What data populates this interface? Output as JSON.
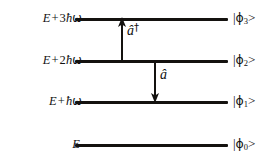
{
  "figure": {
    "background_color": "#ffffff",
    "line_color": "#14120f",
    "text_color": "#111111",
    "width": 280,
    "height": 161
  },
  "levels": [
    {
      "index": 3,
      "energy_label": {
        "base": "E",
        "plus": "+",
        "coefficient": "3",
        "hbar": "ħ",
        "omega": "ω"
      },
      "energy_text": "E + 3ħω",
      "ket": {
        "bar": "|",
        "phi": "ϕ",
        "subscript": "3",
        "close": ">"
      },
      "ket_text": "|ϕ₃>",
      "line_y": 18
    },
    {
      "index": 2,
      "energy_label": {
        "base": "E",
        "plus": "+",
        "coefficient": "2",
        "hbar": "ħ",
        "omega": "ω"
      },
      "energy_text": "E + 2ħω",
      "ket": {
        "bar": "|",
        "phi": "ϕ",
        "subscript": "2",
        "close": ">"
      },
      "ket_text": "|ϕ₂>",
      "line_y": 60
    },
    {
      "index": 1,
      "energy_label": {
        "base": "E",
        "plus": "+",
        "coefficient": "",
        "hbar": "ħ",
        "omega": "ω"
      },
      "energy_text": "E + ħω",
      "ket": {
        "bar": "|",
        "phi": "ϕ",
        "subscript": "1",
        "close": ">"
      },
      "ket_text": "|ϕ₁>",
      "line_y": 101
    },
    {
      "index": 0,
      "energy_label": {
        "base": "E",
        "plus": "",
        "coefficient": "",
        "hbar": "",
        "omega": ""
      },
      "energy_text": "E",
      "ket": {
        "bar": "|",
        "phi": "ϕ",
        "subscript": "0",
        "close": ">"
      },
      "ket_text": "|ϕ₀>",
      "line_y": 144
    }
  ],
  "arrows": [
    {
      "name": "creation",
      "direction": "up",
      "from_level": 2,
      "to_level": 3,
      "operator": {
        "symbol": "â",
        "dagger": "†"
      },
      "operator_text": "â†",
      "x": 122,
      "y_start": 60,
      "y_end": 20
    },
    {
      "name": "annihilation",
      "direction": "down",
      "from_level": 2,
      "to_level": 1,
      "operator": {
        "symbol": "â",
        "dagger": ""
      },
      "operator_text": "â",
      "x": 155,
      "y_start": 60,
      "y_end": 100
    }
  ]
}
